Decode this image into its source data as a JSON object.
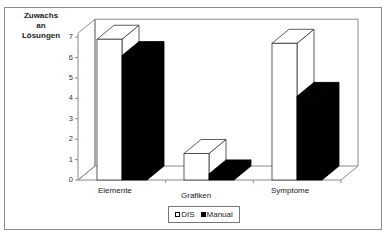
{
  "chart_data": {
    "type": "bar",
    "style": "3d-clustered-column",
    "title": "",
    "ylabel": "Zuwachs an Lösungen",
    "ylabel_lines": [
      "Zuwachs",
      "an Lösungen"
    ],
    "xlabel": "",
    "categories": [
      "Elemente",
      "Grafiken",
      "Symptome"
    ],
    "series": [
      {
        "name": "DIS",
        "color": "#ffffff",
        "values": [
          6.9,
          1.3,
          6.7
        ]
      },
      {
        "name": "Manual",
        "color": "#000000",
        "values": [
          6.1,
          0.3,
          4.1
        ]
      }
    ],
    "yticks": [
      "0",
      "1",
      "2",
      "3",
      "4",
      "5",
      "6",
      "7"
    ],
    "ylim": [
      0,
      7
    ],
    "grid": false,
    "legend_position": "bottom"
  },
  "legend": {
    "items": [
      {
        "label": "DIS"
      },
      {
        "label": "Manual"
      }
    ]
  }
}
